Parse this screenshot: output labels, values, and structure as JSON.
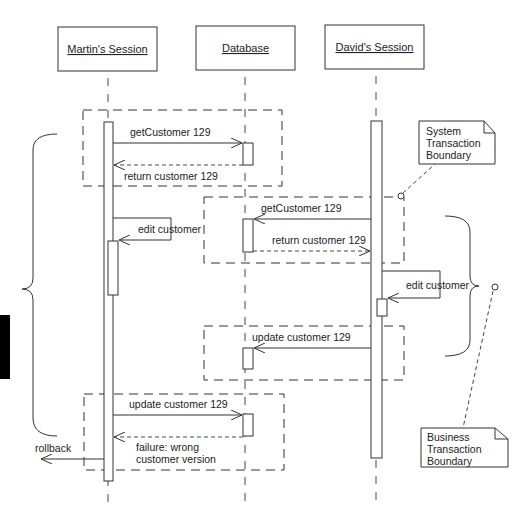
{
  "participants": [
    {
      "id": "martin",
      "label": "Martin's Session"
    },
    {
      "id": "database",
      "label": "Database"
    },
    {
      "id": "david",
      "label": "David's Session"
    }
  ],
  "messages": [
    {
      "id": "m1",
      "from": "martin",
      "to": "database",
      "type": "sync",
      "label": "getCustomer 129"
    },
    {
      "id": "m2",
      "from": "database",
      "to": "martin",
      "type": "return",
      "label": "return customer 129"
    },
    {
      "id": "m3",
      "from": "david",
      "to": "database",
      "type": "sync",
      "label": "getCustomer 129"
    },
    {
      "id": "m4",
      "from": "database",
      "to": "david",
      "type": "return",
      "label": "return customer 129"
    },
    {
      "id": "m5",
      "from": "martin",
      "to": "martin",
      "type": "self",
      "label": "edit customer"
    },
    {
      "id": "m6",
      "from": "david",
      "to": "david",
      "type": "self",
      "label": "edit customer"
    },
    {
      "id": "m7",
      "from": "david",
      "to": "database",
      "type": "sync",
      "label": "update customer 129"
    },
    {
      "id": "m8",
      "from": "martin",
      "to": "database",
      "type": "sync",
      "label": "update customer 129"
    },
    {
      "id": "m9",
      "from": "database",
      "to": "martin",
      "type": "return",
      "label_lines": [
        "failure:  wrong",
        "customer version"
      ]
    },
    {
      "id": "m10",
      "from": "martin",
      "to": "external",
      "type": "sync",
      "label": "rollback"
    }
  ],
  "notes": {
    "system": {
      "lines": [
        "System",
        "Transaction",
        "Boundary"
      ]
    },
    "business": {
      "lines": [
        "Business",
        "Transaction",
        "Boundary"
      ]
    }
  },
  "colors": {
    "stroke": "#333333",
    "text": "#222222",
    "background": "#ffffff",
    "margin_mark": "#000000"
  }
}
